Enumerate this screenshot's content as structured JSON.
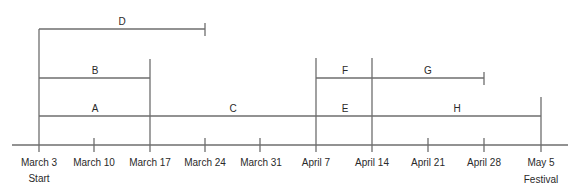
{
  "diagram": {
    "type": "timeline / activity network",
    "colors": {
      "line": "#6e6e6e",
      "text": "#2a2a2a",
      "background": "#ffffff"
    },
    "axis": {
      "ticks": [
        {
          "label": "March 3",
          "sublabel": "Start"
        },
        {
          "label": "March 10"
        },
        {
          "label": "March 17"
        },
        {
          "label": "March 24"
        },
        {
          "label": "March 31"
        },
        {
          "label": "April 7"
        },
        {
          "label": "April 14"
        },
        {
          "label": "April 21"
        },
        {
          "label": "April 28"
        },
        {
          "label": "May 5",
          "sublabel": "Festival"
        }
      ]
    },
    "activities": [
      {
        "id": "A",
        "label": "A",
        "from": "March 3",
        "to": "March 17"
      },
      {
        "id": "B",
        "label": "B",
        "from": "March 3",
        "to": "March 17"
      },
      {
        "id": "C",
        "label": "C",
        "from": "March 17",
        "to": "April 7"
      },
      {
        "id": "D",
        "label": "D",
        "from": "March 3",
        "to": "March 24"
      },
      {
        "id": "E",
        "label": "E",
        "from": "April 7",
        "to": "April 14"
      },
      {
        "id": "F",
        "label": "F",
        "from": "April 7",
        "to": "April 14"
      },
      {
        "id": "G",
        "label": "G",
        "from": "April 14",
        "to": "April 28"
      },
      {
        "id": "H",
        "label": "H",
        "from": "April 14",
        "to": "May 5"
      }
    ]
  }
}
